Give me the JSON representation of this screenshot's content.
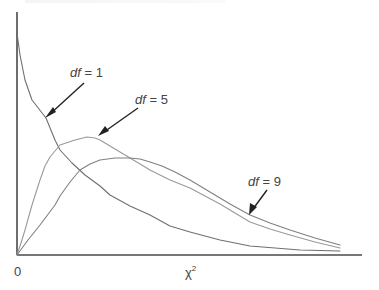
{
  "chart_data": {
    "type": "line",
    "title": "",
    "xlabel": "χ²",
    "ylabel": "",
    "x_tick_labels": [
      "0"
    ],
    "grid": false,
    "legend": "inline annotations with arrows",
    "x_range_chi2": [
      0,
      21
    ],
    "series": [
      {
        "name": "df = 1",
        "df": 1,
        "shape": "monotonically decreasing from high value at 0",
        "pixel_points": [
          [
            17,
            33
          ],
          [
            20,
            55
          ],
          [
            25,
            80
          ],
          [
            32,
            100
          ],
          [
            46,
            118
          ],
          [
            55,
            140
          ],
          [
            60,
            150
          ],
          [
            72,
            163
          ],
          [
            85,
            175
          ],
          [
            100,
            186
          ],
          [
            110,
            195
          ],
          [
            130,
            206
          ],
          [
            150,
            215
          ],
          [
            170,
            226
          ],
          [
            190,
            232
          ],
          [
            220,
            240
          ],
          [
            250,
            246
          ],
          [
            300,
            250
          ],
          [
            340,
            251
          ]
        ]
      },
      {
        "name": "df = 5",
        "df": 5,
        "shape": "right-skewed, peak near chi2 = 3",
        "pixel_points": [
          [
            17,
            255
          ],
          [
            21,
            243
          ],
          [
            25,
            230
          ],
          [
            32,
            205
          ],
          [
            40,
            180
          ],
          [
            45,
            166
          ],
          [
            50,
            157
          ],
          [
            60,
            145
          ],
          [
            75,
            140
          ],
          [
            87,
            137
          ],
          [
            95,
            138
          ],
          [
            100,
            140
          ],
          [
            110,
            146
          ],
          [
            120,
            152
          ],
          [
            135,
            161
          ],
          [
            150,
            170
          ],
          [
            170,
            180
          ],
          [
            190,
            188
          ],
          [
            220,
            204
          ],
          [
            250,
            222
          ],
          [
            270,
            229
          ],
          [
            290,
            235
          ],
          [
            315,
            242
          ],
          [
            340,
            248
          ]
        ]
      },
      {
        "name": "df = 9",
        "df": 9,
        "shape": "right-skewed, flatter, peak near chi2 = 7",
        "pixel_points": [
          [
            17,
            255
          ],
          [
            28,
            240
          ],
          [
            40,
            225
          ],
          [
            55,
            205
          ],
          [
            60,
            196
          ],
          [
            70,
            182
          ],
          [
            80,
            170
          ],
          [
            90,
            164
          ],
          [
            100,
            160
          ],
          [
            115,
            158
          ],
          [
            130,
            158
          ],
          [
            140,
            159
          ],
          [
            150,
            162
          ],
          [
            162,
            166
          ],
          [
            175,
            172
          ],
          [
            190,
            180
          ],
          [
            210,
            192
          ],
          [
            230,
            204
          ],
          [
            250,
            215
          ],
          [
            270,
            223
          ],
          [
            290,
            230
          ],
          [
            315,
            238
          ],
          [
            340,
            245
          ]
        ]
      }
    ]
  },
  "annotations": {
    "df1": {
      "var": "df",
      "eq": " = 1"
    },
    "df5": {
      "var": "df",
      "eq": " = 5"
    },
    "df9": {
      "var": "df",
      "eq": " = 9"
    }
  },
  "axes": {
    "origin_label": "0",
    "x_label_base": "χ",
    "x_label_sup": "2"
  },
  "colors": {
    "df1": "#6f6f6f",
    "df5": "#9a9a9a",
    "df9": "#808080",
    "axis": "#4a4a4a",
    "arrow": "#222222"
  }
}
